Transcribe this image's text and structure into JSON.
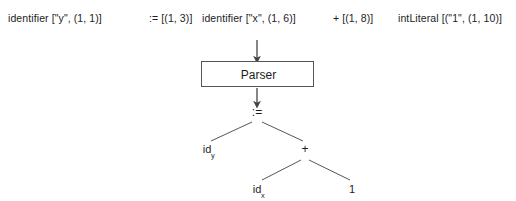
{
  "diagram": {
    "background_color": "#ffffff",
    "line_color": "#555555",
    "text_color": "#1d1d1d"
  },
  "token_stream": {
    "label": "token stream",
    "tokens": [
      {
        "text": "identifier [\"y\", (1, 1)]",
        "x": 8
      },
      {
        "text": ":= [(1, 3)]",
        "x": 149
      },
      {
        "text": "identifier [\"x\", (1, 6)]",
        "x": 202
      },
      {
        "text": "+ [(1, 8)]",
        "x": 333
      },
      {
        "text": "intLiteral [(\"1\", (1, 10)]",
        "x": 398
      }
    ]
  },
  "parser": {
    "label": "Parser",
    "box": {
      "left": 201,
      "top": 61,
      "width": 113,
      "height": 26
    }
  },
  "arrows": {
    "into_parser": {
      "x": 257,
      "y1": 40,
      "y2": 61
    },
    "out_of_parser": {
      "x": 257,
      "y1": 88,
      "y2": 106
    }
  },
  "parse_tree": {
    "nodes": [
      {
        "id": "root",
        "label": ":=",
        "sub": "",
        "x": 257,
        "y": 110,
        "kind": "operator"
      },
      {
        "id": "id-y",
        "label": "id",
        "sub": "y",
        "x": 209,
        "y": 148,
        "kind": "leaf"
      },
      {
        "id": "plus",
        "label": "+",
        "sub": "",
        "x": 305,
        "y": 148,
        "kind": "operator"
      },
      {
        "id": "id-x",
        "label": "id",
        "sub": "x",
        "x": 259,
        "y": 188,
        "kind": "leaf"
      },
      {
        "id": "one",
        "label": "1",
        "sub": "",
        "x": 352,
        "y": 188,
        "kind": "leaf"
      }
    ],
    "edges": [
      {
        "from": "root",
        "to": "id-y",
        "x1": 252,
        "y1": 122,
        "x2": 211,
        "y2": 140
      },
      {
        "from": "root",
        "to": "plus",
        "x1": 262,
        "y1": 122,
        "x2": 303,
        "y2": 140
      },
      {
        "from": "plus",
        "to": "id-x",
        "x1": 301,
        "y1": 160,
        "x2": 262,
        "y2": 180
      },
      {
        "from": "plus",
        "to": "one",
        "x1": 309,
        "y1": 160,
        "x2": 350,
        "y2": 180
      }
    ]
  }
}
